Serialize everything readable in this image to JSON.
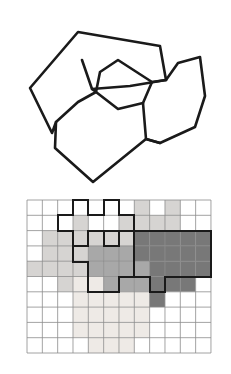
{
  "figure": {
    "background_color": "#ffffff",
    "width": 231,
    "height": 374
  },
  "palette": {
    "outline_color": "#1a1a1a",
    "grid_line_color": "#8c8c8c",
    "region_border_color": "#1a1a1a",
    "empty_cell_color": "#ffffff",
    "shade_very_light": "#eeeae6",
    "shade_light": "#d6d4d2",
    "shade_medium": "#a8a8a8",
    "shade_dark": "#787878"
  },
  "vector_panel": {
    "name": "vector-polygon-map",
    "stroke_width": 2.6,
    "polygons": [
      {
        "id": "region-a",
        "label": "large outer left polygon",
        "fill": "none",
        "points": "78,32 30,88 52,133 78,154 118,130 97,104 92,89 82,60"
      },
      {
        "id": "region-b",
        "label": "upper middle polygon",
        "fill": "none",
        "points": "78,32 82,60 92,89 130,86 166,80 160,46"
      },
      {
        "id": "region-c",
        "label": "right polygon",
        "fill": "none",
        "points": "166,80 178,63 200,57 205,96 195,127 160,143 144,120 155,97"
      },
      {
        "id": "region-d",
        "label": "center small polygon",
        "fill": "none",
        "points": "118,60 100,72 96,92 118,109 143,103 152,82"
      },
      {
        "id": "region-e",
        "label": "lower center large polygon",
        "fill": "none",
        "points": "78,102 56,122 55,148 93,182 146,139 124,116 101,112"
      },
      {
        "id": "region-f",
        "label": "lower right polygon",
        "fill": "none",
        "points": "146,139 160,143 195,127 175,117 152,110 134,106"
      }
    ],
    "paths": [
      {
        "id": "outline-outer-boundary",
        "label": "outer boundary of the whole map",
        "d": "M 78,32 L 30,88 L 52,133 L 56,122 L 55,148 L 93,182 L 146,139 L 160,143 L 195,127 L 205,96 L 200,57 L 178,63 L 166,80 L 160,46 L 78,32 Z"
      },
      {
        "id": "outline-inner-1",
        "label": "interior edge between left and lower polygons",
        "d": "M 82,60 L 92,89 L 96,92 L 78,102 L 56,122"
      },
      {
        "id": "outline-inner-2",
        "label": "interior edge of middle polygon top",
        "d": "M 92,89 L 130,86 L 166,80"
      },
      {
        "id": "outline-inner-3",
        "label": "small center polygon outline",
        "d": "M 118,60 L 100,72 L 96,92 L 118,109 L 143,103 L 152,82 Z"
      },
      {
        "id": "outline-inner-4",
        "label": "edge from center polygon to right polygon",
        "d": "M 152,82 L 166,80"
      },
      {
        "id": "outline-inner-5",
        "label": "edge from lower center polygon to right",
        "d": "M 143,103 L 146,139 L 160,143"
      }
    ]
  },
  "raster_panel": {
    "name": "rasterized-grid",
    "grid": {
      "origin_x": 27,
      "origin_y": 10,
      "cols": 12,
      "rows": 10,
      "cell_width": 15.33,
      "cell_height": 15.3,
      "grid_line_width": 0.8,
      "region_border_width": 2.0
    },
    "shade_keys": {
      "0": "empty_cell_color",
      "1": "shade_very_light",
      "2": "shade_light",
      "3": "shade_medium",
      "4": "shade_dark"
    },
    "cells": [
      [
        0,
        0,
        0,
        0,
        0,
        0,
        0,
        2,
        0,
        2,
        0,
        0
      ],
      [
        0,
        0,
        0,
        2,
        0,
        0,
        2,
        2,
        2,
        2,
        0,
        0
      ],
      [
        0,
        2,
        2,
        2,
        2,
        2,
        2,
        4,
        4,
        4,
        4,
        4
      ],
      [
        0,
        2,
        2,
        2,
        3,
        3,
        3,
        4,
        4,
        4,
        4,
        4
      ],
      [
        2,
        2,
        2,
        2,
        3,
        3,
        3,
        3,
        4,
        4,
        4,
        4
      ],
      [
        0,
        0,
        2,
        1,
        1,
        3,
        3,
        3,
        4,
        4,
        4,
        0
      ],
      [
        0,
        0,
        0,
        1,
        1,
        1,
        1,
        1,
        4,
        0,
        0,
        0
      ],
      [
        0,
        0,
        0,
        1,
        1,
        1,
        1,
        1,
        0,
        0,
        0,
        0
      ],
      [
        0,
        0,
        0,
        1,
        1,
        1,
        1,
        1,
        0,
        0,
        0,
        0
      ],
      [
        0,
        0,
        0,
        0,
        1,
        1,
        1,
        0,
        0,
        0,
        0,
        0
      ]
    ],
    "region_outline_paths": [
      {
        "id": "raster-region-outline-light",
        "label": "boundary of light gray rasterized region",
        "d": "M 73,10 L 88,10 L 88,25 L 104,25 L 104,10 L 119,10 L 119,25 L 134,25 L 134,41 L 119,41 L 119,56 L 104,56 L 104,41 L 88,41 L 88,56 L 73,56 L 73,41 L 58,41 L 58,25 L 73,25 Z"
      },
      {
        "id": "raster-region-outline-medium",
        "label": "boundary of medium gray rasterized region",
        "d": "M 88,41 L 134,41 L 134,87 L 119,87 L 119,102 L 88,102 L 88,72 L 73,72 L 73,56 L 88,56 Z"
      },
      {
        "id": "raster-region-outline-dark",
        "label": "boundary of dark gray rasterized region",
        "d": "M 134,41 L 211,41 L 211,87 L 165,87 L 165,102 L 150,102 L 150,87 L 134,87 Z"
      }
    ]
  }
}
